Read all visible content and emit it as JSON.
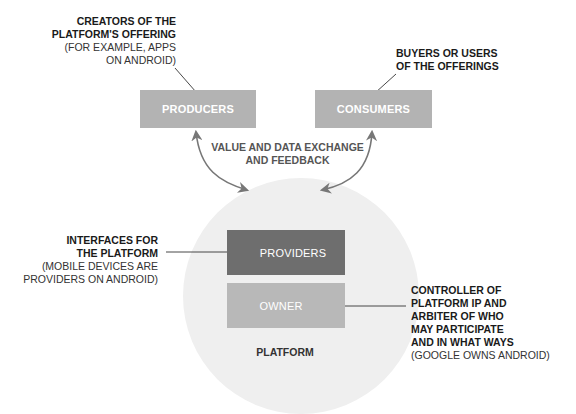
{
  "colors": {
    "producer_box": "#b3b3b3",
    "consumer_box": "#b3b3b3",
    "providers_box": "#6e6e6e",
    "owner_box": "#b8b8b8",
    "platform_circle": "#efefef",
    "arrow": "#777777",
    "leader_line": "#333333"
  },
  "boxes": {
    "producers": "PRODUCERS",
    "consumers": "CONSUMERS",
    "providers": "PROVIDERS",
    "owner": "OWNER"
  },
  "platform_label": "PLATFORM",
  "exchange_label": {
    "line1": "VALUE AND DATA EXCHANGE",
    "line2": "AND FEEDBACK"
  },
  "annotations": {
    "producers": {
      "bold": [
        "CREATORS OF THE",
        "PLATFORM'S OFFERING"
      ],
      "normal": [
        "(FOR EXAMPLE, APPS",
        "ON ANDROID)"
      ]
    },
    "consumers": {
      "bold": [
        "BUYERS OR USERS",
        "OF THE OFFERINGS"
      ],
      "normal": []
    },
    "providers": {
      "bold": [
        "INTERFACES FOR",
        "THE PLATFORM"
      ],
      "normal": [
        "(MOBILE DEVICES ARE",
        "PROVIDERS ON ANDROID)"
      ]
    },
    "owner": {
      "bold": [
        "CONTROLLER OF",
        "PLATFORM IP AND",
        "ARBITER OF WHO",
        "MAY PARTICIPATE",
        "AND IN WHAT WAYS"
      ],
      "normal": [
        "(GOOGLE OWNS ANDROID)"
      ]
    }
  }
}
